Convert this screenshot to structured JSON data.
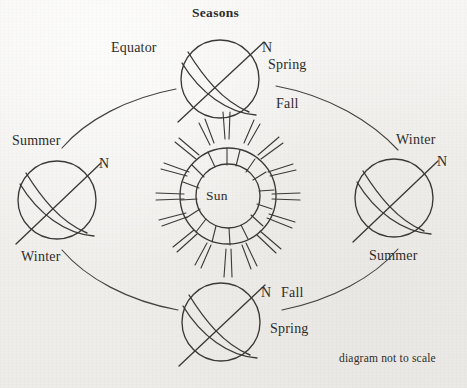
{
  "figure": {
    "title": "Seasons",
    "footnote": "diagram not to scale",
    "sun_label": "Sun",
    "colors": {
      "background": "#f2f1ef",
      "ink": "#3c3a38",
      "text": "#2e2c2a"
    }
  },
  "globes": {
    "top": {
      "name": "top-globe",
      "pole_label": "N",
      "equator_label": "Equator",
      "season_near": "Spring",
      "season_far": "Fall"
    },
    "left": {
      "name": "left-globe",
      "pole_label": "N",
      "season_top": "Summer",
      "season_bottom": "Winter"
    },
    "right": {
      "name": "right-globe",
      "pole_label": "N",
      "season_top": "Winter",
      "season_bottom": "Summer"
    },
    "bottom": {
      "name": "bottom-globe",
      "pole_label": "N",
      "season_near": "Fall",
      "season_far": "Spring"
    }
  },
  "labels": [
    {
      "id": "title",
      "text": "Seasons"
    },
    {
      "id": "equator",
      "text": "Equator"
    },
    {
      "id": "top-n",
      "text": "N"
    },
    {
      "id": "top-spring",
      "text": "Spring"
    },
    {
      "id": "top-fall",
      "text": "Fall"
    },
    {
      "id": "left-summer",
      "text": "Summer"
    },
    {
      "id": "left-n",
      "text": "N"
    },
    {
      "id": "left-winter",
      "text": "Winter"
    },
    {
      "id": "sun",
      "text": "Sun"
    },
    {
      "id": "right-winter",
      "text": "Winter"
    },
    {
      "id": "right-n",
      "text": "N"
    },
    {
      "id": "right-summer",
      "text": "Summer"
    },
    {
      "id": "bottom-n",
      "text": "N"
    },
    {
      "id": "bottom-fall",
      "text": "Fall"
    },
    {
      "id": "bottom-spring",
      "text": "Spring"
    },
    {
      "id": "footnote",
      "text": "diagram not to scale"
    }
  ]
}
